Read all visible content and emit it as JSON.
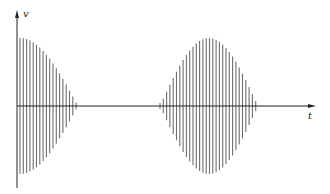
{
  "diagram": {
    "type": "amplitude-modulated wave (beats)",
    "axes": {
      "y_label": "v",
      "x_label": "t"
    },
    "colors": {
      "axis": "#222222",
      "wave": "#6e6e6e",
      "background": "#ffffff"
    },
    "packets": [
      {
        "name": "first-packet",
        "x_start": 20,
        "x_end": 78,
        "peak_x": 20,
        "peak_half_height": 68
      },
      {
        "name": "second-packet",
        "x_start": 160,
        "x_end": 258,
        "peak_x": 209,
        "peak_half_height": 68
      }
    ]
  }
}
